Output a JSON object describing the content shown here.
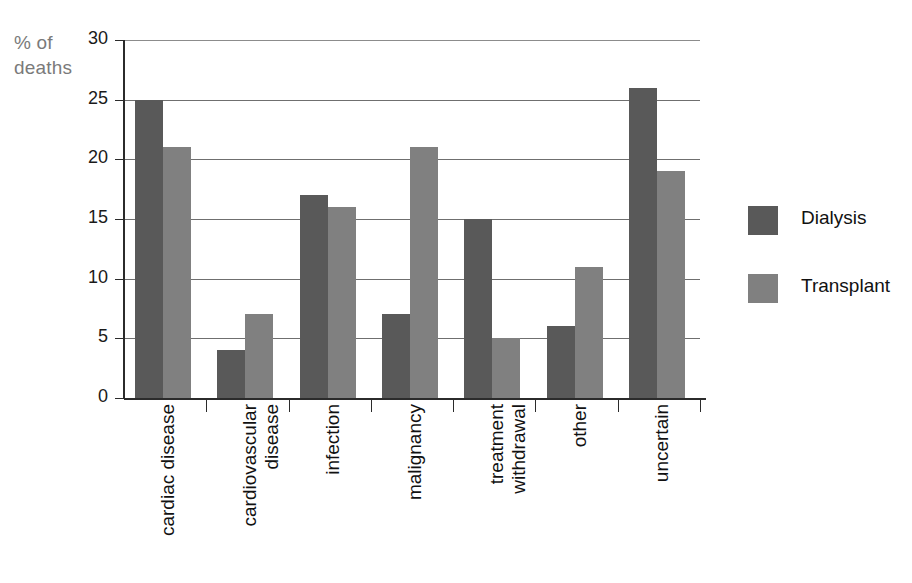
{
  "chart_data": {
    "type": "bar",
    "title": "",
    "subtitle": "",
    "xlabel": "",
    "ylabel": "% of deaths",
    "ylabel_lines": [
      "% of",
      "deaths"
    ],
    "ylim": [
      0,
      30
    ],
    "ytick_step": 5,
    "yticks": [
      0,
      5,
      10,
      15,
      20,
      25,
      30
    ],
    "ytick_labels": [
      "0",
      "5",
      "10",
      "15",
      "20",
      "25",
      "30"
    ],
    "grid": true,
    "grid_axis": "y",
    "legend_position": "right",
    "categories": [
      "cardiac disease",
      "cardiovascular disease",
      "infection",
      "malignancy",
      "treatment withdrawal",
      "other",
      "uncertain"
    ],
    "category_label_lines": [
      [
        "cardiac disease"
      ],
      [
        "cardiovascular",
        "disease"
      ],
      [
        "infection"
      ],
      [
        "malignancy"
      ],
      [
        "treatment",
        "withdrawal"
      ],
      [
        "other"
      ],
      [
        "uncertain"
      ]
    ],
    "series": [
      {
        "name": "Dialysis",
        "color": "#595959",
        "values": [
          25,
          4,
          17,
          7,
          15,
          6,
          26
        ]
      },
      {
        "name": "Transplant",
        "color": "#808080",
        "values": [
          21,
          7,
          16,
          21,
          5,
          11,
          19
        ]
      }
    ]
  },
  "legend": {
    "items": [
      {
        "label": "Dialysis",
        "color": "#595959"
      },
      {
        "label": "Transplant",
        "color": "#808080"
      }
    ]
  },
  "colors": {
    "dialysis": "#595959",
    "transplant": "#808080",
    "axis": "#2b2b2b",
    "gridline": "#6f6f6f",
    "axis_title_text": "#7a7a7a",
    "tick_text": "#1a1a1a",
    "background": "#ffffff"
  }
}
